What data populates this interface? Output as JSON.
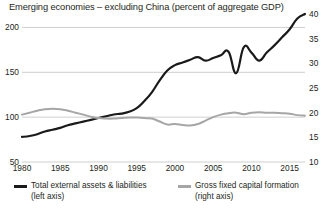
{
  "chart_data": {
    "type": "line",
    "title": "Emerging economies – excluding China (percent of aggregate GDP)",
    "xlabel": "",
    "ylabel": "",
    "grid": true,
    "legend_position": "bottom",
    "xlim": [
      1980,
      2017
    ],
    "xticks": [
      1980,
      1985,
      1990,
      1995,
      2000,
      2005,
      2010,
      2015
    ],
    "left_axis": {
      "label": "left axis",
      "ylim": [
        50,
        215
      ],
      "yticks": [
        50,
        100,
        150,
        200
      ]
    },
    "right_axis": {
      "label": "right axis",
      "ylim": [
        10,
        40
      ],
      "yticks": [
        10,
        15,
        20,
        25,
        30,
        35,
        40
      ]
    },
    "series": [
      {
        "name": "Total external assets & liabilities",
        "axis": "left",
        "color": "#1a1a1a",
        "legend_label": "Total external assets & liabilities",
        "legend_sub": "(left axis)",
        "x": [
          1980,
          1981,
          1982,
          1983,
          1984,
          1985,
          1986,
          1987,
          1988,
          1989,
          1990,
          1991,
          1992,
          1993,
          1994,
          1995,
          1996,
          1997,
          1998,
          1999,
          2000,
          2001,
          2002,
          2003,
          2004,
          2005,
          2006,
          2007,
          2008,
          2009,
          2010,
          2011,
          2012,
          2013,
          2014,
          2015,
          2016,
          2017
        ],
        "values": [
          78,
          79,
          81,
          84,
          86,
          88,
          91,
          93,
          95,
          97,
          99,
          101,
          103,
          104,
          106,
          110,
          118,
          128,
          141,
          152,
          158,
          161,
          164,
          167,
          163,
          166,
          169,
          173,
          149,
          178,
          172,
          163,
          172,
          180,
          189,
          198,
          210,
          215
        ]
      },
      {
        "name": "Gross fixed capital formation",
        "axis": "right",
        "color": "#a6a6a6",
        "legend_label": "Gross fixed capital formation",
        "legend_sub": "(right axis)",
        "x": [
          1980,
          1981,
          1982,
          1983,
          1984,
          1985,
          1986,
          1987,
          1988,
          1989,
          1990,
          1991,
          1992,
          1993,
          1994,
          1995,
          1996,
          1997,
          1998,
          1999,
          2000,
          2001,
          2002,
          2003,
          2004,
          2005,
          2006,
          2007,
          2008,
          2009,
          2010,
          2011,
          2012,
          2013,
          2014,
          2015,
          2016,
          2017
        ],
        "values": [
          19.6,
          20.0,
          20.4,
          20.7,
          20.8,
          20.7,
          20.4,
          20.0,
          19.6,
          19.2,
          18.9,
          18.8,
          18.8,
          18.9,
          19.0,
          19.0,
          18.9,
          18.8,
          18.2,
          17.6,
          17.7,
          17.5,
          17.4,
          17.7,
          18.4,
          19.1,
          19.6,
          19.9,
          20.0,
          19.7,
          20.0,
          20.1,
          20.0,
          20.0,
          19.9,
          19.8,
          19.5,
          19.4
        ]
      }
    ]
  }
}
